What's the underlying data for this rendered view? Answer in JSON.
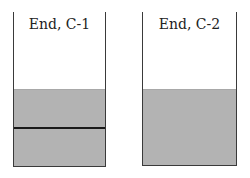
{
  "containers": [
    {
      "label": "End, C-1",
      "has_divider": true
    },
    {
      "label": "End, C-2",
      "has_divider": false
    }
  ],
  "colors": {
    "wall": "#3a3a3a",
    "fill": "#b3b3b3",
    "divider": "#1a1a1a"
  }
}
